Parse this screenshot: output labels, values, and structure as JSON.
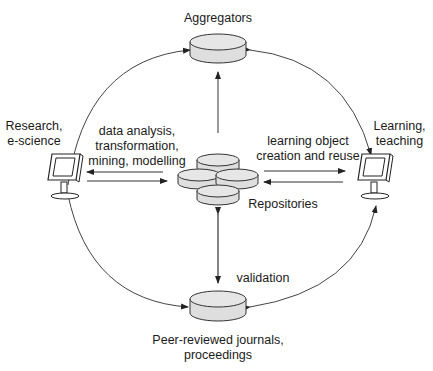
{
  "diagram": {
    "type": "flow",
    "style": {
      "cylinder_fill": "#e0e0e0",
      "stroke": "#333333",
      "background": "#ffffff"
    },
    "nodes": {
      "aggregators": {
        "label": "Aggregators",
        "shape": "cylinder"
      },
      "repositories": {
        "label": "Repositories",
        "shape": "cylinder-cluster"
      },
      "journals": {
        "label_line1": "Peer-reviewed journals,",
        "label_line2": "proceedings",
        "shape": "cylinder"
      },
      "research": {
        "label_line1": "Research,",
        "label_line2": "e-science",
        "shape": "computer-monitor"
      },
      "learning": {
        "label_line1": "Learning,",
        "label_line2": "teaching",
        "shape": "computer-monitor"
      }
    },
    "edge_labels": {
      "research_repo_line1": "data analysis,",
      "research_repo_line2": "transformation,",
      "research_repo_line3": "mining, modelling",
      "learning_repo_line1": "learning object",
      "learning_repo_line2": "creation and reuse",
      "validation": "validation"
    },
    "edges": [
      {
        "from": "repositories",
        "to": "aggregators",
        "direction": "one-way"
      },
      {
        "from": "research",
        "to": "aggregators",
        "direction": "one-way",
        "curve": "arc"
      },
      {
        "from": "aggregators",
        "to": "learning",
        "direction": "two-way",
        "curve": "arc"
      },
      {
        "from": "research",
        "to": "repositories",
        "direction": "two-way",
        "label": "data analysis, transformation, mining, modelling"
      },
      {
        "from": "learning",
        "to": "repositories",
        "direction": "two-way",
        "label": "learning object creation and reuse"
      },
      {
        "from": "repositories",
        "to": "journals",
        "direction": "two-way",
        "label": "validation"
      },
      {
        "from": "research",
        "to": "journals",
        "direction": "one-way",
        "curve": "arc"
      },
      {
        "from": "journals",
        "to": "learning",
        "direction": "two-way",
        "curve": "arc"
      }
    ]
  }
}
